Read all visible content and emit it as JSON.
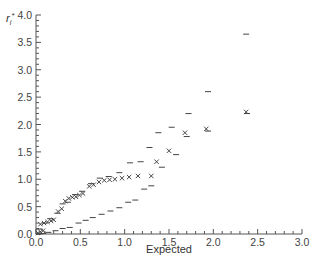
{
  "chart_data": {
    "type": "scatter",
    "title": "",
    "xlabel": "Expected",
    "ylabel": "r_i*",
    "xlim": [
      0,
      3.0
    ],
    "ylim": [
      0,
      4.0
    ],
    "grid": false,
    "legend": null,
    "xticks": [
      "0.0",
      "0.5",
      "1.0",
      "1.5",
      "2.0",
      "2.5",
      "3.0"
    ],
    "yticks": [
      "0.0",
      "0.5",
      "1.0",
      "1.5",
      "2.0",
      "2.5",
      "3.0",
      "3.5",
      "4.0"
    ],
    "series": [
      {
        "name": "observed",
        "marker": "x",
        "points": [
          [
            0.02,
            0.02
          ],
          [
            0.05,
            0.04
          ],
          [
            0.08,
            0.06
          ],
          [
            0.05,
            0.18
          ],
          [
            0.09,
            0.2
          ],
          [
            0.13,
            0.22
          ],
          [
            0.17,
            0.24
          ],
          [
            0.2,
            0.26
          ],
          [
            0.25,
            0.41
          ],
          [
            0.29,
            0.46
          ],
          [
            0.33,
            0.6
          ],
          [
            0.37,
            0.65
          ],
          [
            0.41,
            0.67
          ],
          [
            0.45,
            0.68
          ],
          [
            0.49,
            0.71
          ],
          [
            0.53,
            0.74
          ],
          [
            0.6,
            0.87
          ],
          [
            0.65,
            0.9
          ],
          [
            0.71,
            0.95
          ],
          [
            0.77,
            0.98
          ],
          [
            0.83,
            0.99
          ],
          [
            0.89,
            1.0
          ],
          [
            0.97,
            1.02
          ],
          [
            1.05,
            1.04
          ],
          [
            1.15,
            1.06
          ],
          [
            1.3,
            1.06
          ],
          [
            1.36,
            1.32
          ],
          [
            1.5,
            1.52
          ],
          [
            1.68,
            1.85
          ],
          [
            1.92,
            1.92
          ],
          [
            2.37,
            2.23
          ]
        ]
      },
      {
        "name": "upper_envelope",
        "marker": "-",
        "points": [
          [
            0.04,
            0.09
          ],
          [
            0.1,
            0.2
          ],
          [
            0.16,
            0.28
          ],
          [
            0.24,
            0.38
          ],
          [
            0.3,
            0.55
          ],
          [
            0.36,
            0.58
          ],
          [
            0.44,
            0.72
          ],
          [
            0.52,
            0.78
          ],
          [
            0.62,
            0.92
          ],
          [
            0.72,
            1.02
          ],
          [
            0.82,
            1.05
          ],
          [
            0.94,
            1.12
          ],
          [
            1.06,
            1.3
          ],
          [
            1.18,
            1.32
          ],
          [
            1.28,
            1.58
          ],
          [
            1.38,
            1.85
          ],
          [
            1.53,
            1.95
          ],
          [
            1.72,
            2.2
          ],
          [
            1.94,
            2.6
          ],
          [
            2.37,
            3.65
          ]
        ]
      },
      {
        "name": "lower_envelope",
        "marker": "-",
        "points": [
          [
            0.03,
            0.0
          ],
          [
            0.08,
            0.01
          ],
          [
            0.14,
            0.03
          ],
          [
            0.22,
            0.06
          ],
          [
            0.3,
            0.1
          ],
          [
            0.38,
            0.12
          ],
          [
            0.48,
            0.2
          ],
          [
            0.56,
            0.25
          ],
          [
            0.64,
            0.3
          ],
          [
            0.74,
            0.36
          ],
          [
            0.84,
            0.42
          ],
          [
            0.94,
            0.48
          ],
          [
            1.04,
            0.58
          ],
          [
            1.12,
            0.62
          ],
          [
            1.22,
            0.82
          ],
          [
            1.3,
            0.88
          ],
          [
            1.42,
            1.22
          ],
          [
            1.58,
            1.45
          ],
          [
            1.7,
            1.78
          ],
          [
            1.94,
            1.88
          ],
          [
            2.38,
            2.2
          ]
        ]
      }
    ]
  }
}
